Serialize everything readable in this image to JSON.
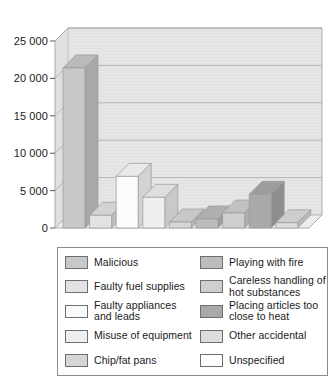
{
  "chart_data": {
    "type": "bar",
    "title": "",
    "subtitle": "",
    "xlabel": "",
    "ylabel": "",
    "ylim": [
      0,
      25000
    ],
    "yticks": [
      0,
      5000,
      10000,
      15000,
      20000,
      25000
    ],
    "ytick_labels": [
      "0",
      "5 000",
      "10 000",
      "15 000",
      "20 000",
      "25 000"
    ],
    "grid": true,
    "grid_axis": "y",
    "legend_position": "bottom",
    "three_d": true,
    "categories": [
      "Malicious",
      "Faulty fuel supplies",
      "Faulty appliances and leads",
      "Misuse of equipment",
      "Chip/fat pans",
      "Playing with fire",
      "Careless handling of hot substances",
      "Other accidental",
      "Unspecified"
    ],
    "values": [
      21400,
      1700,
      6900,
      4100,
      800,
      1200,
      2000,
      4500,
      700
    ],
    "colors": [
      "#c8c8c8",
      "#e2e2e2",
      "#fbfbfb",
      "#efefef",
      "#d6d6d6",
      "#bcbcbc",
      "#cfcfcf",
      "#a9a9a9",
      "#dcdcdc"
    ]
  },
  "axis": {
    "ticks": [
      {
        "label": "25 000",
        "value": 25000
      },
      {
        "label": "20 000",
        "value": 20000
      },
      {
        "label": "15 000",
        "value": 15000
      },
      {
        "label": "10 000",
        "value": 10000
      },
      {
        "label": "5 000",
        "value": 5000
      },
      {
        "label": "0",
        "value": 0
      }
    ]
  },
  "legend": {
    "columns": 2,
    "entries": [
      {
        "label": "Malicious",
        "swatch": "#c8c8c8",
        "column": 0,
        "row": 0
      },
      {
        "label": "Faulty fuel supplies",
        "swatch": "#e2e2e2",
        "column": 0,
        "row": 1
      },
      {
        "label": "Faulty appliances and leads",
        "swatch": "#fbfbfb",
        "column": 0,
        "row": 2
      },
      {
        "label": "Misuse of equipment",
        "swatch": "#efefef",
        "column": 0,
        "row": 3
      },
      {
        "label": "Chip/fat pans",
        "swatch": "#d6d6d6",
        "column": 0,
        "row": 4
      },
      {
        "label": "Playing with fire",
        "swatch": "#bcbcbc",
        "column": 1,
        "row": 0
      },
      {
        "label": "Careless handling of hot substances",
        "swatch": "#cfcfcf",
        "column": 1,
        "row": 1
      },
      {
        "label": "Placing articles too close to heat",
        "swatch": "#a9a9a9",
        "column": 1,
        "row": 2
      },
      {
        "label": "Other accidental",
        "swatch": "#dcdcdc",
        "column": 1,
        "row": 3
      },
      {
        "label": "Unspecified",
        "swatch": "#ffffff",
        "column": 1,
        "row": 4
      }
    ]
  },
  "palette": {
    "plot_floor": "#e8e8e8",
    "plot_back": "#e4e4e4",
    "plot_wall": "#dedede",
    "grid_line": "#a8a8a8",
    "frame_line": "#9a9a9a",
    "text": "#1a1a1a",
    "legend_border": "#8b8b8b"
  }
}
